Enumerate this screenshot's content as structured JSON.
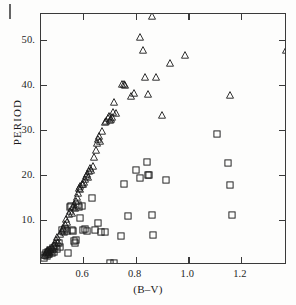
{
  "figure": {
    "background_color": "#fdfdfc",
    "axis_color": "#3a3a3a",
    "marker_color": "#1a1a1a"
  },
  "artifact": {
    "name": "scan-edge-mark"
  },
  "axes": {
    "x": {
      "title": "(B–V)",
      "ticks": [
        "0.6",
        "0.8",
        "1.0",
        "1.2"
      ],
      "tick_values": [
        0.6,
        0.8,
        1.0,
        1.2
      ],
      "min": 0.44,
      "max": 1.375
    },
    "y": {
      "title": "PERIOD",
      "ticks": [
        "10.",
        "20.",
        "30.",
        "40.",
        "50."
      ],
      "tick_values": [
        10,
        20,
        30,
        40,
        50
      ],
      "min": 0.0,
      "max": 55.8
    }
  },
  "chart_data": {
    "type": "scatter",
    "title": "",
    "xlabel": "(B–V)",
    "ylabel": "PERIOD",
    "xlim": [
      0.44,
      1.375
    ],
    "ylim": [
      0.0,
      55.8
    ],
    "xticks": [
      0.6,
      0.8,
      1.0,
      1.2
    ],
    "yticks": [
      10,
      20,
      30,
      40,
      50
    ],
    "grid": false,
    "legend": null,
    "series": [
      {
        "name": "triangles",
        "marker": "triangle-open",
        "points": [
          [
            0.455,
            2.3
          ],
          [
            0.458,
            2.8
          ],
          [
            0.462,
            3.1
          ],
          [
            0.465,
            2.5
          ],
          [
            0.468,
            3.4
          ],
          [
            0.47,
            2.9
          ],
          [
            0.474,
            3.6
          ],
          [
            0.478,
            3.2
          ],
          [
            0.482,
            4.0
          ],
          [
            0.486,
            3.5
          ],
          [
            0.49,
            4.4
          ],
          [
            0.494,
            4.9
          ],
          [
            0.498,
            5.6
          ],
          [
            0.502,
            6.2
          ],
          [
            0.506,
            5.1
          ],
          [
            0.512,
            6.9
          ],
          [
            0.518,
            7.6
          ],
          [
            0.524,
            8.3
          ],
          [
            0.53,
            9.1
          ],
          [
            0.536,
            10.2
          ],
          [
            0.54,
            9.6
          ],
          [
            0.546,
            11.3
          ],
          [
            0.552,
            12.1
          ],
          [
            0.556,
            11.6
          ],
          [
            0.56,
            13.0
          ],
          [
            0.564,
            13.6
          ],
          [
            0.568,
            12.7
          ],
          [
            0.572,
            14.2
          ],
          [
            0.576,
            15.1
          ],
          [
            0.58,
            16.0
          ],
          [
            0.584,
            17.2
          ],
          [
            0.588,
            17.6
          ],
          [
            0.59,
            16.8
          ],
          [
            0.594,
            18.1
          ],
          [
            0.598,
            17.9
          ],
          [
            0.602,
            18.4
          ],
          [
            0.606,
            19.2
          ],
          [
            0.61,
            19.8
          ],
          [
            0.614,
            20.3
          ],
          [
            0.618,
            19.5
          ],
          [
            0.622,
            21.0
          ],
          [
            0.626,
            21.6
          ],
          [
            0.63,
            21.2
          ],
          [
            0.636,
            22.0
          ],
          [
            0.642,
            23.9
          ],
          [
            0.648,
            25.6
          ],
          [
            0.652,
            27.1
          ],
          [
            0.656,
            28.0
          ],
          [
            0.66,
            28.6
          ],
          [
            0.666,
            27.6
          ],
          [
            0.672,
            29.7
          ],
          [
            0.682,
            31.8
          ],
          [
            0.688,
            32.0
          ],
          [
            0.694,
            32.6
          ],
          [
            0.698,
            33.1
          ],
          [
            0.702,
            32.2
          ],
          [
            0.706,
            32.4
          ],
          [
            0.71,
            32.9
          ],
          [
            0.714,
            34.1
          ],
          [
            0.718,
            36.2
          ],
          [
            0.724,
            33.9
          ],
          [
            0.748,
            40.2
          ],
          [
            0.754,
            40.3
          ],
          [
            0.76,
            40.0
          ],
          [
            0.782,
            37.5
          ],
          [
            0.792,
            38.2
          ],
          [
            0.816,
            50.6
          ],
          [
            0.828,
            47.9
          ],
          [
            0.836,
            41.8
          ],
          [
            0.846,
            38.0
          ],
          [
            0.862,
            55.3
          ],
          [
            0.878,
            41.8
          ],
          [
            0.9,
            33.4
          ],
          [
            0.93,
            44.8
          ],
          [
            0.988,
            46.6
          ],
          [
            1.158,
            37.8
          ],
          [
            1.372,
            47.8
          ]
        ]
      },
      {
        "name": "squares",
        "marker": "square-open",
        "points": [
          [
            0.452,
            1.6
          ],
          [
            0.456,
            2.2
          ],
          [
            0.46,
            2.6
          ],
          [
            0.464,
            2.0
          ],
          [
            0.468,
            2.9
          ],
          [
            0.472,
            2.4
          ],
          [
            0.476,
            3.3
          ],
          [
            0.48,
            2.7
          ],
          [
            0.484,
            3.8
          ],
          [
            0.49,
            3.0
          ],
          [
            0.496,
            4.2
          ],
          [
            0.502,
            3.6
          ],
          [
            0.508,
            4.8
          ],
          [
            0.514,
            4.1
          ],
          [
            0.52,
            7.8
          ],
          [
            0.526,
            7.4
          ],
          [
            0.532,
            7.9
          ],
          [
            0.538,
            7.6
          ],
          [
            0.544,
            2.6
          ],
          [
            0.55,
            12.8
          ],
          [
            0.554,
            13.1
          ],
          [
            0.558,
            7.8
          ],
          [
            0.562,
            7.5
          ],
          [
            0.566,
            5.3
          ],
          [
            0.57,
            5.0
          ],
          [
            0.574,
            5.6
          ],
          [
            0.58,
            13.3
          ],
          [
            0.584,
            12.9
          ],
          [
            0.59,
            10.4
          ],
          [
            0.596,
            13.2
          ],
          [
            0.6,
            7.7
          ],
          [
            0.606,
            7.9
          ],
          [
            0.614,
            7.6
          ],
          [
            0.632,
            14.9
          ],
          [
            0.646,
            7.8
          ],
          [
            0.656,
            9.4
          ],
          [
            0.668,
            7.3
          ],
          [
            0.682,
            7.4
          ],
          [
            0.702,
            0.5
          ],
          [
            0.718,
            0.4
          ],
          [
            0.744,
            6.4
          ],
          [
            0.756,
            17.9
          ],
          [
            0.772,
            11.0
          ],
          [
            0.8,
            21.2
          ],
          [
            0.816,
            19.4
          ],
          [
            0.844,
            22.8
          ],
          [
            0.848,
            19.9
          ],
          [
            0.852,
            20.1
          ],
          [
            0.862,
            11.1
          ],
          [
            0.866,
            6.7
          ],
          [
            0.916,
            18.9
          ],
          [
            1.108,
            29.1
          ],
          [
            1.152,
            22.7
          ],
          [
            1.16,
            17.8
          ],
          [
            1.166,
            11.2
          ]
        ]
      }
    ]
  }
}
